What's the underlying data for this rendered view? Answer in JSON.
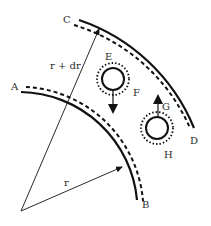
{
  "diagram": {
    "labels": {
      "A": "A",
      "B": "B",
      "C": "C",
      "D": "D",
      "E": "E",
      "F": "F",
      "G": "G",
      "H": "H",
      "r": "r",
      "r_dr": "r + dr"
    },
    "colors": {
      "stroke": "#111111",
      "text": "#2a2a2a",
      "background": "#ffffff"
    }
  }
}
